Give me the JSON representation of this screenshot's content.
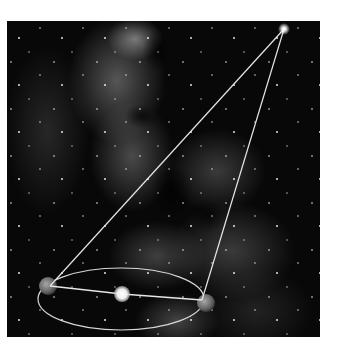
{
  "diagram": {
    "background": "milky-way-starfield",
    "colors": {
      "line": "#e6e6e6",
      "orbit": "#d8d8d8",
      "sun": "#f4f4f4",
      "earth": "#7a7a7a",
      "star": "#ffffff",
      "frame_bg": "#080808"
    },
    "elements": {
      "distant_star": {
        "cx": 284,
        "cy": 29,
        "r": 3
      },
      "sun": {
        "cx": 122,
        "cy": 294,
        "r": 8
      },
      "earth_left": {
        "cx": 48,
        "cy": 286,
        "r": 9
      },
      "earth_right": {
        "cx": 206,
        "cy": 303,
        "r": 9
      },
      "orbit": {
        "cx": 121,
        "cy": 299,
        "rx": 83,
        "ry": 31
      }
    }
  }
}
